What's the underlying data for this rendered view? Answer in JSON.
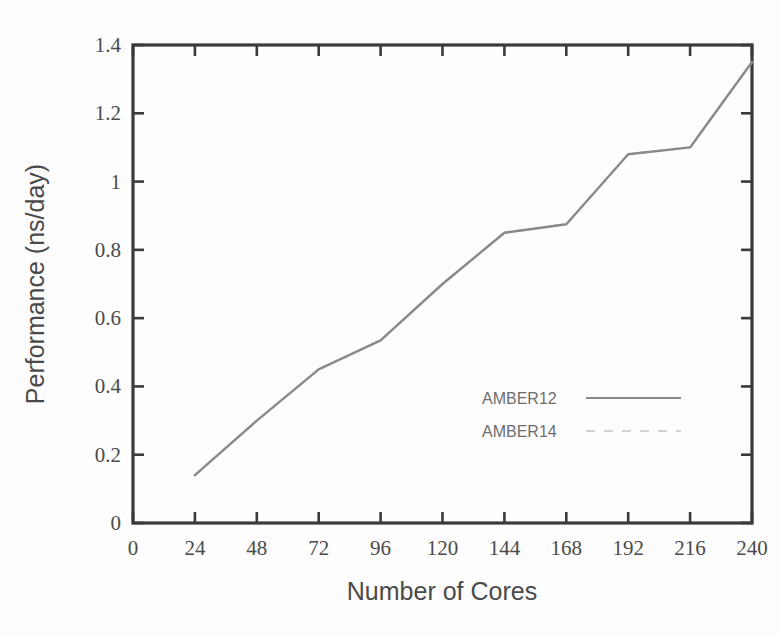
{
  "chart_data": {
    "type": "line",
    "title": "",
    "subtitle": "",
    "xlabel": "Number of Cores",
    "ylabel": "Performance (ns/day)",
    "xlim": [
      0,
      240
    ],
    "ylim": [
      0,
      1.4
    ],
    "grid": false,
    "legend_position": "center-right",
    "x_ticks": [
      0,
      24,
      48,
      72,
      96,
      120,
      144,
      168,
      192,
      216,
      240
    ],
    "x_tick_labels": [
      "0",
      "24",
      "48",
      "72",
      "96",
      "120",
      "144",
      "168",
      "192",
      "216",
      "240"
    ],
    "y_ticks": [
      0,
      0.2,
      0.4,
      0.6,
      0.8,
      1,
      1.2,
      1.4
    ],
    "y_tick_labels": [
      "0",
      "0.2",
      "0.4",
      "0.6",
      "0.8",
      "1",
      "1.2",
      "1.4"
    ],
    "x": [
      24,
      48,
      72,
      96,
      120,
      144,
      168,
      192,
      216,
      240
    ],
    "series": [
      {
        "name": "AMBER12",
        "style": "solid",
        "color": "#8a8a8a",
        "values": [
          0.14,
          0.3,
          0.45,
          0.535,
          0.7,
          0.85,
          0.875,
          1.08,
          1.1,
          1.35
        ]
      },
      {
        "name": "AMBER14",
        "style": "dashed",
        "color": "#c9c9c9",
        "values": [
          0.14,
          0.3,
          0.45,
          0.535,
          0.7,
          0.85,
          0.875,
          1.08,
          1.1,
          1.35
        ]
      }
    ],
    "annotations": []
  },
  "legend": {
    "entries": [
      {
        "label": "AMBER12"
      },
      {
        "label": "AMBER14"
      }
    ]
  },
  "axes": {
    "x_title": "Number of Cores",
    "y_title": "Performance (ns/day)"
  },
  "colors": {
    "axis": "#3a3a3a",
    "tick_text": "#4b4b4b",
    "title_text": "#4a4a4a",
    "series_amber12": "#8a8a8a",
    "series_amber14": "#c9c9c9",
    "background": "#fdfdfd"
  }
}
